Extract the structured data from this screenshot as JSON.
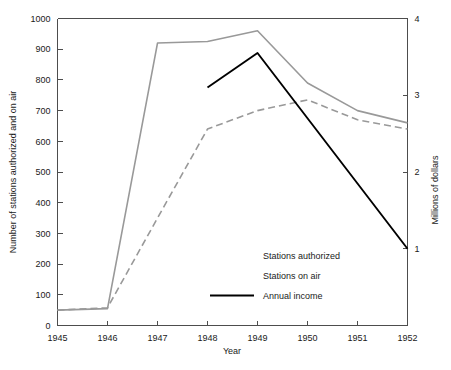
{
  "chart_data": {
    "type": "line",
    "title": "",
    "xlabel": "Year",
    "ylabel": "Number of stations authorized and on air",
    "y2label": "Millions of dollars",
    "x": [
      1945,
      1946,
      1947,
      1948,
      1949,
      1950,
      1951,
      1952
    ],
    "xticklabels": [
      "1945",
      "1946",
      "1947",
      "1948",
      "1949",
      "1950",
      "1951",
      "1952"
    ],
    "xlim": [
      1945,
      1952
    ],
    "ylim": [
      0,
      1000
    ],
    "yticks": [
      0,
      100,
      200,
      300,
      400,
      500,
      600,
      700,
      800,
      900,
      1000
    ],
    "yticklabels": [
      "0",
      "100",
      "200",
      "300",
      "400",
      "500",
      "600",
      "700",
      "800",
      "900",
      "1000"
    ],
    "y2lim": [
      0,
      4
    ],
    "y2ticks": [
      1,
      2,
      3,
      4
    ],
    "y2ticklabels": [
      "1",
      "2",
      "3",
      "4"
    ],
    "grid": false,
    "legend_position": "center-right-inside",
    "series": [
      {
        "name": "Stations authorized",
        "axis": "left",
        "style": "solid",
        "color": "#999999",
        "x": [
          1945,
          1946,
          1947,
          1948,
          1949,
          1950,
          1951,
          1952
        ],
        "values": [
          50,
          55,
          920,
          925,
          960,
          790,
          700,
          660
        ]
      },
      {
        "name": "Stations on air",
        "axis": "left",
        "style": "dashed",
        "color": "#999999",
        "x": [
          1945,
          1946,
          1947,
          1948,
          1949,
          1950,
          1951,
          1952
        ],
        "values": [
          50,
          58,
          350,
          640,
          700,
          735,
          670,
          640
        ]
      },
      {
        "name": "Annual income",
        "axis": "right",
        "style": "solid",
        "color": "#000000",
        "x": [
          1948,
          1949,
          1950,
          1951,
          1952
        ],
        "values": [
          3.1,
          3.55,
          2.7,
          1.85,
          1.0
        ]
      }
    ]
  },
  "legend": {
    "entries": [
      {
        "label": "Stations authorized",
        "swatch": false
      },
      {
        "label": "Stations on air",
        "swatch": false
      },
      {
        "label": "Annual income",
        "swatch": true
      }
    ]
  }
}
